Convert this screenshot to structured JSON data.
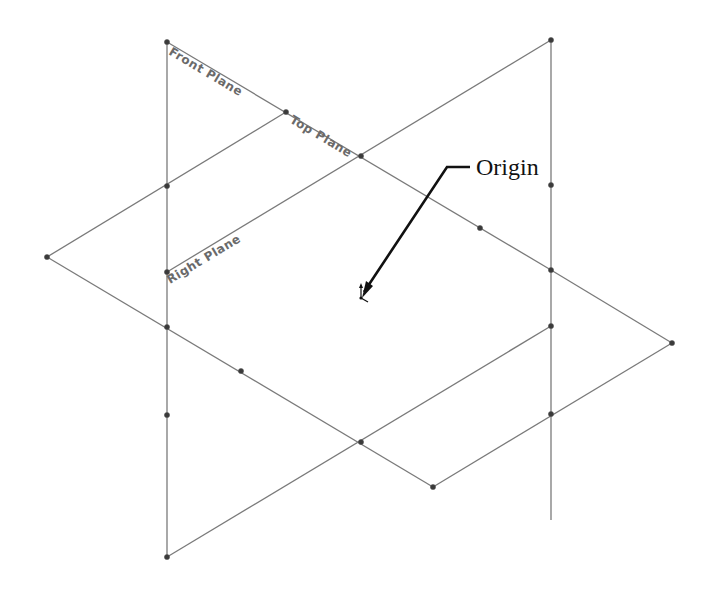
{
  "diagram": {
    "type": "isometric-reference-planes",
    "planes": [
      {
        "name": "Front Plane",
        "label": "Front Plane"
      },
      {
        "name": "Top Plane",
        "label": "Top Plane"
      },
      {
        "name": "Right Plane",
        "label": "Right Plane"
      }
    ],
    "callout": {
      "label": "Origin"
    },
    "colors": {
      "plane_edge": "#7a7a7a",
      "vertex": "#3a3a3a",
      "label_text": "#6a6a6a",
      "callout_text": "#111111",
      "background": "#ffffff"
    },
    "segments": [
      [
        167,
        42,
        167,
        557
      ],
      [
        551,
        40,
        551,
        520
      ],
      [
        167,
        42,
        551,
        270
      ],
      [
        47,
        257,
        286,
        112
      ],
      [
        167,
        272,
        551,
        40
      ],
      [
        551,
        270,
        672,
        343
      ],
      [
        47,
        257,
        433,
        487
      ],
      [
        672,
        343,
        433,
        487
      ],
      [
        551,
        326,
        167,
        557
      ]
    ],
    "vertices": [
      [
        167,
        42
      ],
      [
        551,
        40
      ],
      [
        286,
        112
      ],
      [
        361,
        156
      ],
      [
        167,
        186
      ],
      [
        551,
        185
      ],
      [
        480,
        228
      ],
      [
        47,
        257
      ],
      [
        167,
        272
      ],
      [
        551,
        270
      ],
      [
        167,
        327
      ],
      [
        241,
        371
      ],
      [
        551,
        326
      ],
      [
        672,
        343
      ],
      [
        167,
        415
      ],
      [
        551,
        414
      ],
      [
        361,
        442
      ],
      [
        433,
        487
      ],
      [
        167,
        557
      ]
    ]
  }
}
